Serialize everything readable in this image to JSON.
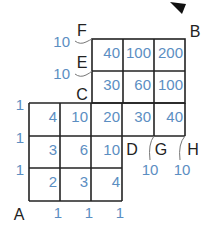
{
  "points": {
    "A": "A",
    "B": "B",
    "C": "C",
    "D": "D",
    "E": "E",
    "F": "F",
    "G": "G",
    "H": "H"
  },
  "upper_grid": {
    "row1": [
      "40",
      "100",
      "200"
    ],
    "row2": [
      "30",
      "60",
      "100"
    ]
  },
  "lower_grid": {
    "row1": [
      "4",
      "10",
      "20",
      "30",
      "40"
    ],
    "row2": [
      "3",
      "6",
      "10"
    ],
    "row3": [
      "2",
      "3",
      "4"
    ]
  },
  "left_labels": [
    "1",
    "1",
    "1"
  ],
  "bottom_labels": [
    "1",
    "1",
    "1"
  ],
  "side_labels": {
    "F": "10",
    "E": "10",
    "G": "10",
    "H": "10"
  }
}
